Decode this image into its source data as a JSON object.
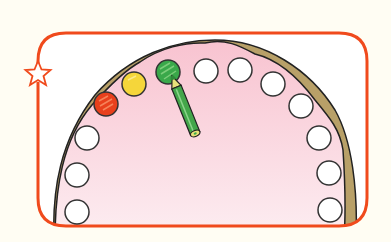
{
  "scene": {
    "description": "Illustration of a dental arch (upper teeth) with a pencil pointing at a green tooth",
    "colors": {
      "background": "#fffdf3",
      "frame": "#f04a1c",
      "gum": "#f9c9d4",
      "gum_light": "#fbe6ec",
      "bone": "#b8a068",
      "outline": "#222222",
      "tooth_white": "#ffffff",
      "tooth_red": "#e8401c",
      "tooth_yellow": "#f5d63a",
      "tooth_green": "#3aa84a",
      "pencil_body": "#43a64a",
      "pencil_tip": "#e8e07a"
    },
    "teeth": [
      {
        "id": 1,
        "state": "white",
        "cx": 77,
        "cy": 212
      },
      {
        "id": 2,
        "state": "white",
        "cx": 77,
        "cy": 175
      },
      {
        "id": 3,
        "state": "white",
        "cx": 87,
        "cy": 138
      },
      {
        "id": 4,
        "state": "red",
        "cx": 106,
        "cy": 104
      },
      {
        "id": 5,
        "state": "yellow",
        "cx": 134,
        "cy": 84
      },
      {
        "id": 6,
        "state": "green",
        "cx": 168,
        "cy": 72
      },
      {
        "id": 7,
        "state": "white",
        "cx": 206,
        "cy": 71
      },
      {
        "id": 8,
        "state": "white",
        "cx": 240,
        "cy": 70
      },
      {
        "id": 9,
        "state": "white",
        "cx": 273,
        "cy": 84
      },
      {
        "id": 10,
        "state": "white",
        "cx": 301,
        "cy": 106
      },
      {
        "id": 11,
        "state": "white",
        "cx": 319,
        "cy": 138
      },
      {
        "id": 12,
        "state": "white",
        "cx": 329,
        "cy": 173
      },
      {
        "id": 13,
        "state": "white",
        "cx": 330,
        "cy": 210
      }
    ],
    "star_icon": "star-outline"
  }
}
